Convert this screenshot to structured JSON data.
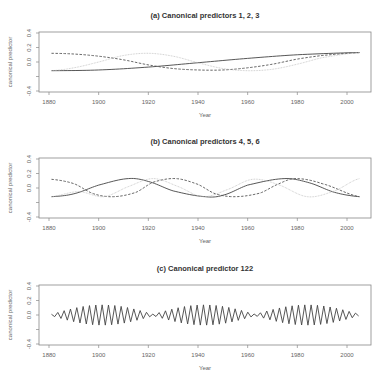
{
  "chart_data": [
    {
      "type": "line",
      "title": "(a) Canonical predictors 1, 2, 3",
      "xlabel": "Year",
      "ylabel": "canonical predictor",
      "xlim": [
        1876,
        2010
      ],
      "ylim": [
        -0.4,
        0.4
      ],
      "xticks": [
        1880,
        1900,
        1920,
        1940,
        1960,
        1980,
        2000
      ],
      "yticks": [
        -0.4,
        -0.2,
        0.0,
        0.2,
        0.4
      ],
      "ytick_labels": [
        "-0.4",
        "",
        "0.0",
        "0.2",
        "0.4"
      ],
      "grid": false,
      "series": [
        {
          "name": "predictor 1",
          "style": "solid",
          "color": "#444444",
          "x": [
            1881,
            1900,
            1920,
            1940,
            1960,
            1980,
            2005
          ],
          "y": [
            -0.12,
            -0.11,
            -0.07,
            -0.01,
            0.05,
            0.1,
            0.13
          ]
        },
        {
          "name": "predictor 2",
          "style": "dashed",
          "color": "#555555",
          "x": [
            1881,
            1890,
            1900,
            1910,
            1920,
            1930,
            1940,
            1950,
            1960,
            1970,
            1980,
            1990,
            2005
          ],
          "y": [
            0.12,
            0.11,
            0.08,
            0.03,
            -0.04,
            -0.09,
            -0.11,
            -0.11,
            -0.08,
            -0.03,
            0.04,
            0.09,
            0.13
          ]
        },
        {
          "name": "predictor 3",
          "style": "dotted",
          "color": "#bbbbbb",
          "x": [
            1881,
            1890,
            1900,
            1910,
            1920,
            1930,
            1940,
            1950,
            1960,
            1970,
            1980,
            1990,
            2005
          ],
          "y": [
            -0.12,
            -0.08,
            0.0,
            0.09,
            0.12,
            0.08,
            -0.01,
            -0.09,
            -0.12,
            -0.1,
            -0.03,
            0.06,
            0.13
          ]
        }
      ]
    },
    {
      "type": "line",
      "title": "(b) Canonical predictors 4, 5, 6",
      "xlabel": "Year",
      "ylabel": "canonical predictor",
      "xlim": [
        1876,
        2010
      ],
      "ylim": [
        -0.4,
        0.4
      ],
      "xticks": [
        1880,
        1900,
        1920,
        1940,
        1960,
        1980,
        2000
      ],
      "yticks": [
        -0.4,
        -0.2,
        0.0,
        0.2,
        0.4
      ],
      "ytick_labels": [
        "-0.4",
        "",
        "0.0",
        "0.2",
        "0.4"
      ],
      "grid": false,
      "series": [
        {
          "name": "predictor 4",
          "style": "solid",
          "color": "#444444",
          "x": [
            1881,
            1890,
            1900,
            1912,
            1920,
            1930,
            1943,
            1950,
            1960,
            1975,
            1985,
            1995,
            2005
          ],
          "y": [
            -0.12,
            -0.08,
            0.04,
            0.13,
            0.09,
            -0.04,
            -0.12,
            -0.1,
            0.04,
            0.13,
            0.07,
            -0.06,
            -0.12
          ]
        },
        {
          "name": "predictor 5",
          "style": "dashed",
          "color": "#555555",
          "x": [
            1881,
            1890,
            1898,
            1906,
            1915,
            1922,
            1931,
            1940,
            1947,
            1955,
            1965,
            1972,
            1979,
            1990,
            2005
          ],
          "y": [
            0.12,
            0.06,
            -0.08,
            -0.12,
            -0.06,
            0.08,
            0.13,
            0.05,
            -0.08,
            -0.12,
            -0.07,
            0.05,
            0.13,
            0.06,
            -0.12
          ]
        },
        {
          "name": "predictor 6",
          "style": "dotted",
          "color": "#bbbbbb",
          "x": [
            1881,
            1892,
            1902,
            1912,
            1922,
            1932,
            1942,
            1952,
            1962,
            1972,
            1984,
            1995,
            2005
          ],
          "y": [
            -0.12,
            -0.05,
            -0.12,
            0.02,
            0.13,
            0.02,
            -0.12,
            -0.02,
            0.12,
            0.05,
            -0.12,
            -0.04,
            0.13
          ]
        }
      ]
    },
    {
      "type": "line",
      "title": "(c) Canonical predictor 122",
      "xlabel": "Year",
      "ylabel": "canonical predictor",
      "xlim": [
        1876,
        2010
      ],
      "ylim": [
        -0.4,
        0.4
      ],
      "xticks": [
        1880,
        1900,
        1920,
        1940,
        1960,
        1980,
        2000
      ],
      "yticks": [
        -0.4,
        -0.2,
        0.0,
        0.2,
        0.4
      ],
      "ytick_labels": [
        "-0.4",
        "",
        "0.0",
        "0.2",
        "0.4"
      ],
      "grid": false,
      "series": [
        {
          "name": "predictor 122",
          "style": "solid",
          "color": "#444444",
          "description": "alternating oscillation (period ~2.5 yr) with amplitude envelope up to ~0.13; node minima near 1880, 1921, 1963, 2005",
          "x_start": 1881,
          "x_end": 2005,
          "period_years": 2.55,
          "max_amplitude": 0.13,
          "envelope_nodes": [
            1881,
            1922,
            1963,
            2005
          ]
        }
      ]
    }
  ]
}
